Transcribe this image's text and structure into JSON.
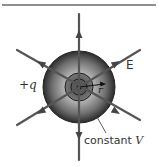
{
  "diagram": {
    "title": "",
    "charge_label": "+q",
    "field_label": "E",
    "radius_label": "r",
    "equipotential_label_prefix": "constant ",
    "equipotential_label_var": "V",
    "colors": {
      "field_line": "#555555",
      "sphere_dark": "#2a2a2a",
      "sphere_light": "#bdbdbd",
      "top_rule": "#6a6a6a",
      "text": "#333333"
    },
    "sphere": {
      "cx": 79,
      "cy": 87,
      "r": 36
    },
    "field_lines": [
      {
        "name": "vertical",
        "from": [
          79,
          14
        ],
        "to": [
          79,
          160
        ]
      },
      {
        "name": "diagonal-descending",
        "from": [
          17,
          50
        ],
        "to": [
          140,
          120
        ]
      },
      {
        "name": "diagonal-ascending",
        "from": [
          17,
          125
        ],
        "to": [
          140,
          50
        ]
      }
    ],
    "arrow_directions": "outward from charge"
  }
}
